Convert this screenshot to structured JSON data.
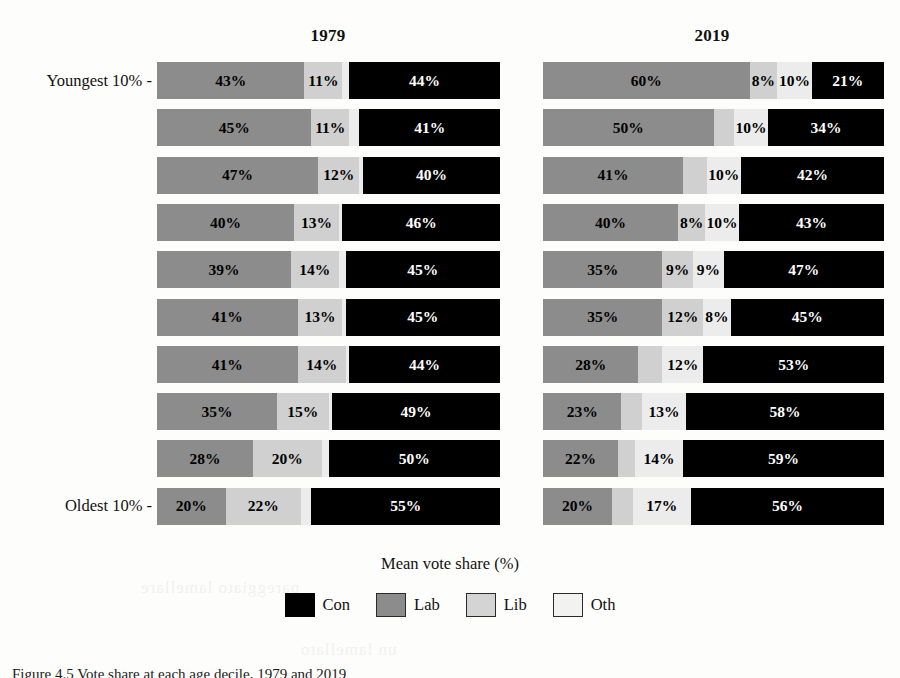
{
  "figure": {
    "axis_title": "Mean vote share (%)",
    "caption": "Figure 4.5 Vote share at each age decile, 1979 and 2019",
    "caption_label": "Figure 4.5",
    "top_label": "Youngest 10% -",
    "bottom_label": "Oldest 10% -",
    "ghost_text_1": "pareggiato lamellare",
    "ghost_text_2": "un lamellato"
  },
  "legend": {
    "position": "bottom-center",
    "items": [
      {
        "name": "Con",
        "color": "#000000"
      },
      {
        "name": "Lab",
        "color": "#8c8c8c"
      },
      {
        "name": "Lib",
        "color": "#d4d4d4"
      },
      {
        "name": "Oth",
        "color": "#f2f2f0"
      }
    ]
  },
  "chart_data": {
    "type": "bar",
    "subtype": "stacked-horizontal",
    "title": "",
    "xlabel": "Mean vote share (%)",
    "ylabel": "",
    "xlim": [
      0,
      100
    ],
    "grid": false,
    "legend_position": "bottom",
    "series_order": [
      "Lab",
      "Lib",
      "Oth",
      "Con"
    ],
    "colors": {
      "Con": "#000000",
      "Lab": "#8c8c8c",
      "Lib": "#d0d0d0",
      "Oth": "#ececec"
    },
    "categories": [
      "Youngest 10%",
      "2nd decile",
      "3rd decile",
      "4th decile",
      "5th decile",
      "6th decile",
      "7th decile",
      "8th decile",
      "9th decile",
      "Oldest 10%"
    ],
    "panels": [
      {
        "title": "1979",
        "rows": [
          {
            "label": "Youngest 10%",
            "segments": [
              {
                "party": "Lab",
                "value": 43,
                "text": "43%"
              },
              {
                "party": "Lib",
                "value": 11,
                "text": "11%"
              },
              {
                "party": "Oth",
                "value": 2,
                "text": ""
              },
              {
                "party": "Con",
                "value": 44,
                "text": "44%"
              }
            ]
          },
          {
            "label": "2nd decile",
            "segments": [
              {
                "party": "Lab",
                "value": 45,
                "text": "45%"
              },
              {
                "party": "Lib",
                "value": 11,
                "text": "11%"
              },
              {
                "party": "Oth",
                "value": 3,
                "text": ""
              },
              {
                "party": "Con",
                "value": 41,
                "text": "41%"
              }
            ]
          },
          {
            "label": "3rd decile",
            "segments": [
              {
                "party": "Lab",
                "value": 47,
                "text": "47%"
              },
              {
                "party": "Lib",
                "value": 12,
                "text": "12%"
              },
              {
                "party": "Oth",
                "value": 1,
                "text": ""
              },
              {
                "party": "Con",
                "value": 40,
                "text": "40%"
              }
            ]
          },
          {
            "label": "4th decile",
            "segments": [
              {
                "party": "Lab",
                "value": 40,
                "text": "40%"
              },
              {
                "party": "Lib",
                "value": 13,
                "text": "13%"
              },
              {
                "party": "Oth",
                "value": 1,
                "text": ""
              },
              {
                "party": "Con",
                "value": 46,
                "text": "46%"
              }
            ]
          },
          {
            "label": "5th decile",
            "segments": [
              {
                "party": "Lab",
                "value": 39,
                "text": "39%"
              },
              {
                "party": "Lib",
                "value": 14,
                "text": "14%"
              },
              {
                "party": "Oth",
                "value": 2,
                "text": ""
              },
              {
                "party": "Con",
                "value": 45,
                "text": "45%"
              }
            ]
          },
          {
            "label": "6th decile",
            "segments": [
              {
                "party": "Lab",
                "value": 41,
                "text": "41%"
              },
              {
                "party": "Lib",
                "value": 13,
                "text": "13%"
              },
              {
                "party": "Oth",
                "value": 1,
                "text": ""
              },
              {
                "party": "Con",
                "value": 45,
                "text": "45%"
              }
            ]
          },
          {
            "label": "7th decile",
            "segments": [
              {
                "party": "Lab",
                "value": 41,
                "text": "41%"
              },
              {
                "party": "Lib",
                "value": 14,
                "text": "14%"
              },
              {
                "party": "Oth",
                "value": 1,
                "text": ""
              },
              {
                "party": "Con",
                "value": 44,
                "text": "44%"
              }
            ]
          },
          {
            "label": "8th decile",
            "segments": [
              {
                "party": "Lab",
                "value": 35,
                "text": "35%"
              },
              {
                "party": "Lib",
                "value": 15,
                "text": "15%"
              },
              {
                "party": "Oth",
                "value": 1,
                "text": ""
              },
              {
                "party": "Con",
                "value": 49,
                "text": "49%"
              }
            ]
          },
          {
            "label": "9th decile",
            "segments": [
              {
                "party": "Lab",
                "value": 28,
                "text": "28%"
              },
              {
                "party": "Lib",
                "value": 20,
                "text": "20%"
              },
              {
                "party": "Oth",
                "value": 2,
                "text": ""
              },
              {
                "party": "Con",
                "value": 50,
                "text": "50%"
              }
            ]
          },
          {
            "label": "Oldest 10%",
            "segments": [
              {
                "party": "Lab",
                "value": 20,
                "text": "20%"
              },
              {
                "party": "Lib",
                "value": 22,
                "text": "22%"
              },
              {
                "party": "Oth",
                "value": 3,
                "text": ""
              },
              {
                "party": "Con",
                "value": 55,
                "text": "55%"
              }
            ]
          }
        ]
      },
      {
        "title": "2019",
        "rows": [
          {
            "label": "Youngest 10%",
            "segments": [
              {
                "party": "Lab",
                "value": 60,
                "text": "60%"
              },
              {
                "party": "Lib",
                "value": 8,
                "text": "8%"
              },
              {
                "party": "Oth",
                "value": 10,
                "text": "10%"
              },
              {
                "party": "Con",
                "value": 21,
                "text": "21%"
              }
            ]
          },
          {
            "label": "2nd decile",
            "segments": [
              {
                "party": "Lab",
                "value": 50,
                "text": "50%"
              },
              {
                "party": "Lib",
                "value": 6,
                "text": ""
              },
              {
                "party": "Oth",
                "value": 10,
                "text": "10%"
              },
              {
                "party": "Con",
                "value": 34,
                "text": "34%"
              }
            ]
          },
          {
            "label": "3rd decile",
            "segments": [
              {
                "party": "Lab",
                "value": 41,
                "text": "41%"
              },
              {
                "party": "Lib",
                "value": 7,
                "text": ""
              },
              {
                "party": "Oth",
                "value": 10,
                "text": "10%"
              },
              {
                "party": "Con",
                "value": 42,
                "text": "42%"
              }
            ]
          },
          {
            "label": "4th decile",
            "segments": [
              {
                "party": "Lab",
                "value": 40,
                "text": "40%"
              },
              {
                "party": "Lib",
                "value": 8,
                "text": "8%"
              },
              {
                "party": "Oth",
                "value": 10,
                "text": "10%"
              },
              {
                "party": "Con",
                "value": 43,
                "text": "43%"
              }
            ]
          },
          {
            "label": "5th decile",
            "segments": [
              {
                "party": "Lab",
                "value": 35,
                "text": "35%"
              },
              {
                "party": "Lib",
                "value": 9,
                "text": "9%"
              },
              {
                "party": "Oth",
                "value": 9,
                "text": "9%"
              },
              {
                "party": "Con",
                "value": 47,
                "text": "47%"
              }
            ]
          },
          {
            "label": "6th decile",
            "segments": [
              {
                "party": "Lab",
                "value": 35,
                "text": "35%"
              },
              {
                "party": "Lib",
                "value": 12,
                "text": "12%"
              },
              {
                "party": "Oth",
                "value": 8,
                "text": "8%"
              },
              {
                "party": "Con",
                "value": 45,
                "text": "45%"
              }
            ]
          },
          {
            "label": "7th decile",
            "segments": [
              {
                "party": "Lab",
                "value": 28,
                "text": "28%"
              },
              {
                "party": "Lib",
                "value": 7,
                "text": ""
              },
              {
                "party": "Oth",
                "value": 12,
                "text": "12%"
              },
              {
                "party": "Con",
                "value": 53,
                "text": "53%"
              }
            ]
          },
          {
            "label": "8th decile",
            "segments": [
              {
                "party": "Lab",
                "value": 23,
                "text": "23%"
              },
              {
                "party": "Lib",
                "value": 6,
                "text": ""
              },
              {
                "party": "Oth",
                "value": 13,
                "text": "13%"
              },
              {
                "party": "Con",
                "value": 58,
                "text": "58%"
              }
            ]
          },
          {
            "label": "9th decile",
            "segments": [
              {
                "party": "Lab",
                "value": 22,
                "text": "22%"
              },
              {
                "party": "Lib",
                "value": 5,
                "text": ""
              },
              {
                "party": "Oth",
                "value": 14,
                "text": "14%"
              },
              {
                "party": "Con",
                "value": 59,
                "text": "59%"
              }
            ]
          },
          {
            "label": "Oldest 10%",
            "segments": [
              {
                "party": "Lab",
                "value": 20,
                "text": "20%"
              },
              {
                "party": "Lib",
                "value": 6,
                "text": ""
              },
              {
                "party": "Oth",
                "value": 17,
                "text": "17%"
              },
              {
                "party": "Con",
                "value": 56,
                "text": "56%"
              }
            ]
          }
        ]
      }
    ]
  }
}
